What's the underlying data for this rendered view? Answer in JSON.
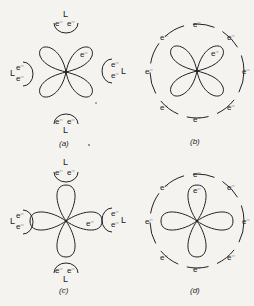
{
  "panels": [
    {
      "id": "a",
      "caption": "(a)",
      "description": "d-orbital lobes between axes (dxy-like) with four ligand electron pairs on axes",
      "lobe_electron": "e⁻",
      "ligand_label": "L",
      "ligand_electrons": "e⁻"
    },
    {
      "id": "b",
      "caption": "(b)",
      "description": "d-orbital lobes between axes within spherical shell of eight electrons",
      "lobe_electron": "e⁻",
      "shell_electron": "e⁻"
    },
    {
      "id": "c",
      "caption": "(c)",
      "description": "d-orbital lobes along axes (dx2-y2-like) pointing at four ligand electron pairs",
      "lobe_electron": "e⁻",
      "ligand_label": "L",
      "ligand_electrons": "e⁻"
    },
    {
      "id": "d",
      "caption": "(d)",
      "description": "d-orbital lobes along axes within spherical shell of eight electrons",
      "lobe_electron": "e⁻",
      "shell_electron": "e⁻"
    }
  ],
  "colors": {
    "background": "#f4f3f0",
    "ink": "#222222"
  }
}
